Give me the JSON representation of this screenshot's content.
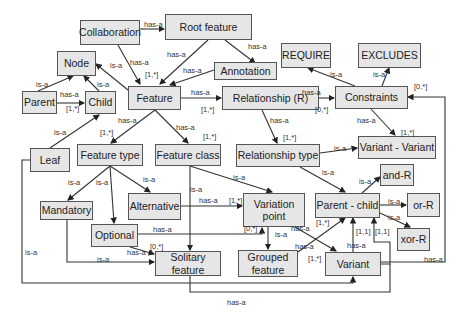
{
  "diagram": {
    "nodes": {
      "collaboration": "Collaboration",
      "root_feature": "Root feature",
      "node": "Node",
      "annotation": "Annotation",
      "require": "REQUIRE",
      "excludes": "EXCLUDES",
      "parent": "Parent",
      "child": "Child",
      "feature": "Feature",
      "relationship_r": "Relationship (R)",
      "constraints": "Constraints",
      "leaf": "Leaf",
      "feature_type": "Feature type",
      "feature_class": "Feature class",
      "relationship_type": "Relationship type",
      "variant_variant": "Variant - Variant",
      "and_r": "and-R",
      "mandatory": "Mandatory",
      "alternative": "Alternative",
      "variation_point": "Variation point",
      "parent_child": "Parent - child",
      "or_r": "or-R",
      "xor_r": "xor-R",
      "optional": "Optional",
      "solitary_feature": "Solitary feature",
      "grouped_feature": "Grouped feature",
      "variant": "Variant"
    },
    "labels": {
      "collab_root": "has-a",
      "collab_feature": "has-a",
      "root_feature": "has-a",
      "root_annotation": "has-a",
      "annotation_feature": "has-a",
      "feature_mult_top": "[1,*]",
      "node_feature": "is-a",
      "parent_node": "is-a",
      "child_node": "is-a",
      "parent_child": "has-a",
      "parent_child_mult": "[1,*]",
      "leaf_child": "is-a",
      "feature_relationship": "has-a",
      "feature_relationship_mult": "[1,*]",
      "feature_type": "has-a",
      "feature_type_mult": "[1,*]",
      "feature_class": "has-a",
      "feature_class_mult": "[1,*]",
      "relationship_constraints": "has-a",
      "relationship_constraints_mult": "[0,*]",
      "constraints_require": "is-a",
      "constraints_excludes": "is-a",
      "constraints_vv": "has-a",
      "constraints_vv_mult": "[1,*]",
      "variant_constraints_mult": "[0,*]",
      "relationship_reltype": "has-a",
      "relationship_reltype_mult": "[1,*]",
      "reltype_vv": "is-a",
      "reltype_pc": "is-a",
      "pc_and": "is-a",
      "pc_or": "is-a",
      "pc_xor": "is-a",
      "ftype_mandatory": "is-a",
      "ftype_optional": "is-a",
      "ftype_alternative": "is-a",
      "fclass_vp": "is-a",
      "fclass_solitary": "is-a",
      "alternative_vp": "has-a",
      "alternative_vp_mult": "[1,*]",
      "optional_vp": "has-a",
      "optional_vp_mult": "[0,*]",
      "optional_solitary": "has-a",
      "optional_solitary_mult": "[0,*]",
      "mandatory_solitary": "is-a",
      "leaf_variant": "is-a",
      "vp_grouped": "is-a",
      "vp_variant": "has-a",
      "grouped_pc": "has-a",
      "pc_mult_left": "[1,*]",
      "variant_mult_left": "[1,*]",
      "variant_pc": "has-a",
      "pc_mult_11a": "[1,1]",
      "pc_mult_11b": "[1,1]",
      "variant_constraints": "has-a",
      "solitary_variant_bottom": "has-a"
    }
  }
}
